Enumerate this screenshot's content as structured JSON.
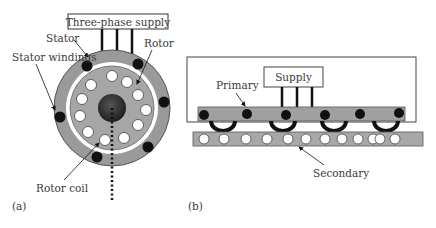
{
  "panel_a": {
    "tag": "(a)",
    "supply_label": "Three-phase supply",
    "labels": {
      "stator": "Stator",
      "stator_windings": "Stator windings",
      "rotor": "Rotor",
      "rotor_coil": "Rotor coil"
    }
  },
  "panel_b": {
    "tag": "(b)",
    "supply_label": "Supply",
    "labels": {
      "primary": "Primary",
      "secondary": "Secondary"
    }
  },
  "colors": {
    "stator_fill": "#9a9a9a",
    "rotor_fill": "#a6a6a6",
    "winding": "#111111",
    "coil_fill": "#ffffff",
    "shaft": "#2a2a2a",
    "primary_fill": "#a0a0a0",
    "secondary_fill": "#a8a8a8"
  }
}
